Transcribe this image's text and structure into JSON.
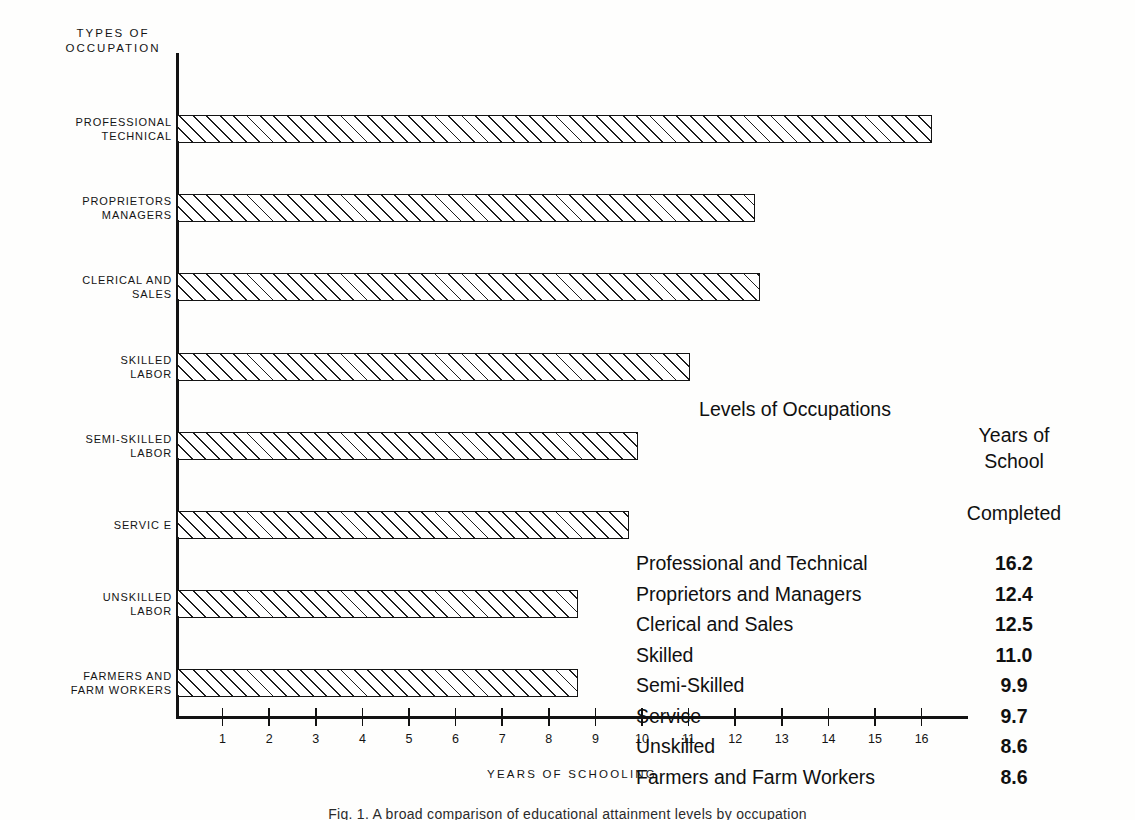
{
  "axis_header": "TYPES OF\nOCCUPATION",
  "x_axis_title": "YEARS OF SCHOOLING",
  "caption": "Fig. 1.  A broad comparison of educational attainment levels by occupation",
  "category_labels": [
    "PROFESSIONAL\nTECHNICAL",
    "PROPRIETORS\nMANAGERS",
    "CLERICAL AND\nSALES",
    "SKILLED\nLABOR",
    "SEMI-SKILLED\nLABOR",
    "SERVIC E",
    "UNSKILLED\nLABOR",
    "FARMERS AND\nFARM WORKERS"
  ],
  "table": {
    "header_left": "Levels of Occupations",
    "header_right_line1": "Years of School",
    "header_right_line2": "Completed",
    "rows": [
      {
        "name": "Professional and Technical",
        "value": "16.2"
      },
      {
        "name": "Proprietors and Managers",
        "value": "12.4"
      },
      {
        "name": "Clerical and Sales",
        "value": "12.5"
      },
      {
        "name": "Skilled",
        "value": "11.0"
      },
      {
        "name": "Semi-Skilled",
        "value": "9.9"
      },
      {
        "name": "Service",
        "value": "9.7"
      },
      {
        "name": "Unskilled",
        "value": "8.6"
      },
      {
        "name": "Farmers and Farm Workers",
        "value": "8.6"
      }
    ]
  },
  "chart_data": {
    "type": "bar",
    "orientation": "horizontal",
    "title": "",
    "xlabel": "YEARS OF SCHOOLING",
    "ylabel": "TYPES OF OCCUPATION",
    "xlim": [
      0,
      17
    ],
    "grid": false,
    "legend": "none",
    "xticks": [
      1,
      2,
      3,
      4,
      5,
      6,
      7,
      8,
      9,
      10,
      11,
      12,
      13,
      14,
      15,
      16
    ],
    "categories": [
      "PROFESSIONAL TECHNICAL",
      "PROPRIETORS MANAGERS",
      "CLERICAL AND SALES",
      "SKILLED LABOR",
      "SEMI-SKILLED LABOR",
      "SERVICE",
      "UNSKILLED LABOR",
      "FARMERS AND FARM WORKERS"
    ],
    "values": [
      16.2,
      12.4,
      12.5,
      11.0,
      9.9,
      9.7,
      8.6,
      8.6
    ]
  },
  "colors": {
    "ink": "#141414",
    "paper": "#fefefd"
  }
}
